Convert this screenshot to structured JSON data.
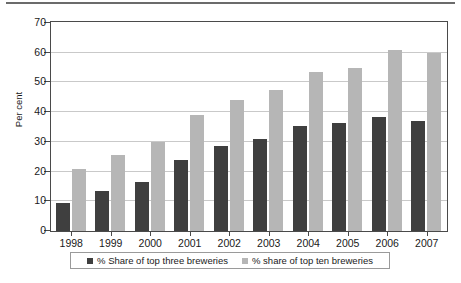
{
  "chart_data": {
    "type": "bar",
    "title": "",
    "xlabel": "",
    "ylabel": "Per cent",
    "ylim": [
      0,
      70
    ],
    "yticks": [
      0,
      10,
      20,
      30,
      40,
      50,
      60,
      70
    ],
    "grid": true,
    "legend_position": "bottom",
    "categories": [
      "1998",
      "1999",
      "2000",
      "2001",
      "2002",
      "2003",
      "2004",
      "2005",
      "2006",
      "2007"
    ],
    "series": [
      {
        "name": "% Share of top three breweries",
        "color": "#3f3f3f",
        "values": [
          9.5,
          13.5,
          16.5,
          24,
          28.5,
          31,
          35.5,
          36.5,
          38.5,
          37
        ]
      },
      {
        "name": "% share of top ten breweries",
        "color": "#b6b6b6",
        "values": [
          21,
          25.5,
          30,
          39,
          44,
          47.5,
          53.5,
          55,
          61,
          60
        ]
      }
    ]
  },
  "axis": {
    "y_title": "Per cent",
    "y_tick_labels": [
      "0",
      "10",
      "20",
      "30",
      "40",
      "50",
      "60",
      "70"
    ],
    "x_tick_labels": [
      "1998",
      "1999",
      "2000",
      "2001",
      "2002",
      "2003",
      "2004",
      "2005",
      "2006",
      "2007"
    ]
  },
  "legend": {
    "entries": [
      {
        "label": "% Share of top three breweries",
        "color": "#3f3f3f"
      },
      {
        "label": "% share of top ten breweries",
        "color": "#b6b6b6"
      }
    ]
  },
  "colors": {
    "series_dark": "#3f3f3f",
    "series_light": "#b6b6b6",
    "gridline": "#c9c9c9",
    "axis": "#4a4a4a",
    "rule": "#6b6b6b"
  }
}
